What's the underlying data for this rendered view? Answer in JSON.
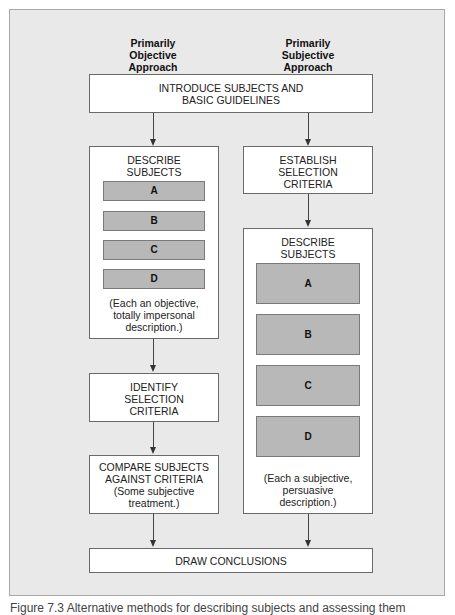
{
  "figure": {
    "headers": {
      "left": [
        "Primarily",
        "Objective",
        "Approach"
      ],
      "right": [
        "Primarily",
        "Subjective",
        "Approach"
      ]
    },
    "intro_box": [
      "INTRODUCE SUBJECTS AND",
      "BASIC GUIDELINES"
    ],
    "left_column": {
      "describe_box": {
        "title": [
          "DESCRIBE",
          "SUBJECTS"
        ],
        "subjects": [
          "A",
          "B",
          "C",
          "D"
        ],
        "note": [
          "(Each an objective,",
          "totally impersonal",
          "description.)"
        ]
      },
      "identify_box": [
        "IDENTIFY",
        "SELECTION",
        "CRITERIA"
      ],
      "compare_box": [
        "COMPARE SUBJECTS",
        "AGAINST CRITERIA",
        "(Some subjective",
        "treatment.)"
      ]
    },
    "right_column": {
      "establish_box": [
        "ESTABLISH",
        "SELECTION",
        "CRITERIA"
      ],
      "describe_box": {
        "title": [
          "DESCRIBE",
          "SUBJECTS"
        ],
        "subjects": [
          "A",
          "B",
          "C",
          "D"
        ],
        "note": [
          "(Each a subjective,",
          "persuasive",
          "description.)"
        ]
      }
    },
    "draw_box": "DRAW CONCLUSIONS",
    "caption": "Figure 7.3 Alternative methods for describing subjects and assessing them"
  }
}
